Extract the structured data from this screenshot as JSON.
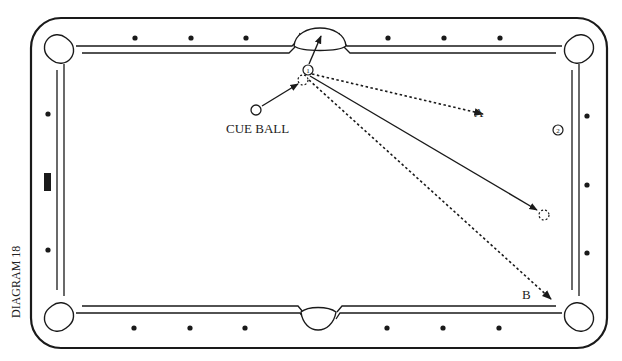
{
  "diagram": {
    "caption": "DIAGRAM 18",
    "labels": {
      "cue_ball": "CUE BALL",
      "path_a": "A",
      "path_b": "B",
      "ball_1": "1",
      "ball_2": "2"
    },
    "colors": {
      "line": "#1a1a1a",
      "background": "#ffffff"
    },
    "table": {
      "outer": {
        "x": 31,
        "y": 18,
        "w": 576,
        "h": 330,
        "radius": 30
      },
      "top_diamonds": [
        [
          135,
          38
        ],
        [
          191,
          38
        ],
        [
          246,
          38
        ],
        [
          388,
          38
        ],
        [
          444,
          38
        ],
        [
          500,
          38
        ]
      ],
      "bottom_diamonds": [
        [
          134,
          328
        ],
        [
          190,
          328
        ],
        [
          245,
          328
        ],
        [
          387,
          328
        ],
        [
          443,
          328
        ],
        [
          499,
          328
        ]
      ],
      "left_diamonds": [
        [
          48,
          114
        ],
        [
          48,
          250
        ]
      ],
      "left_marker": {
        "x": 44,
        "y": 173,
        "w": 7,
        "h": 18
      },
      "right_diamonds": [
        [
          587,
          116
        ],
        [
          587,
          185
        ],
        [
          587,
          253
        ]
      ]
    },
    "balls": {
      "cue_ball": {
        "x": 256,
        "y": 110,
        "r": 5
      },
      "object_ball_1": {
        "x": 308,
        "y": 70,
        "r": 5
      },
      "ghost_ball_contact": {
        "x": 303,
        "y": 80,
        "r": 5
      },
      "object_ball_2": {
        "x": 558,
        "y": 130,
        "r": 5
      },
      "ghost_ball_end": {
        "x": 544,
        "y": 215,
        "r": 5
      }
    },
    "paths": {
      "cue_to_contact": {
        "x1": 262,
        "y1": 106,
        "x2": 298,
        "y2": 84,
        "style": "solid"
      },
      "ball1_to_pocket": {
        "x1": 309,
        "y1": 64,
        "x2": 321,
        "y2": 36,
        "style": "solid"
      },
      "cue_after_solid": {
        "x1": 310,
        "y1": 76,
        "x2": 537,
        "y2": 210,
        "style": "solid"
      },
      "path_a": {
        "x1": 312,
        "y1": 74,
        "x2": 483,
        "y2": 114,
        "style": "dotted"
      },
      "path_b": {
        "x1": 309,
        "y1": 80,
        "x2": 551,
        "y2": 299,
        "style": "dotted"
      }
    },
    "label_positions": {
      "cue_ball": {
        "x": 226,
        "y": 133
      },
      "path_a": {
        "x": 474,
        "y": 117
      },
      "path_b": {
        "x": 522,
        "y": 299
      },
      "caption": {
        "x": 20,
        "y": 318
      }
    }
  }
}
